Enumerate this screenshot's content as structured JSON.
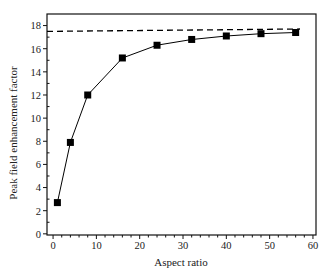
{
  "chart_data": {
    "type": "line",
    "title": "",
    "xlabel": "Aspect ratio",
    "ylabel": "Peak field enhancement factor",
    "xlim": [
      -1.4,
      60.7
    ],
    "ylim": [
      -0.1,
      19.0
    ],
    "xticks": [
      0,
      10,
      20,
      30,
      40,
      50,
      60
    ],
    "xminor_step": 2,
    "yticks": [
      0,
      2,
      4,
      6,
      8,
      10,
      12,
      14,
      16,
      18
    ],
    "yminor_step": 1,
    "grid": false,
    "legend": null,
    "series": [
      {
        "name": "Simulated peak field enhancement",
        "style": "solid-line-square-markers",
        "color": "#000000",
        "x": [
          1,
          4,
          8,
          16,
          24,
          32,
          40,
          48,
          56
        ],
        "y": [
          2.7,
          7.9,
          12.0,
          15.2,
          16.3,
          16.8,
          17.1,
          17.3,
          17.4
        ]
      },
      {
        "name": "Asymptotic limit",
        "style": "dashed-line",
        "color": "#000000",
        "x": [
          -1.4,
          57
        ],
        "y": [
          17.5,
          17.7
        ]
      }
    ]
  }
}
